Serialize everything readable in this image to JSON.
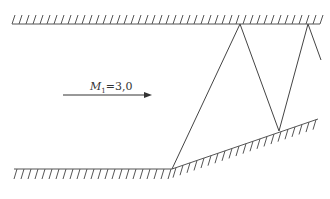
{
  "diagram": {
    "type": "supersonic-channel-shock-reflection",
    "flow_label": {
      "symbol": "M",
      "subscript": "1",
      "equals": "=",
      "value": "3,0"
    },
    "colors": {
      "line": "#444444",
      "background": "#ffffff"
    },
    "upper_wall": {
      "y": 24,
      "x_start": 12,
      "x_end": 320
    },
    "lower_wall": {
      "flat": {
        "x_start": 14,
        "x_end": 172,
        "y": 169
      },
      "ramp": {
        "x_start": 172,
        "y_start": 169,
        "x_end": 318,
        "y_end": 119
      }
    },
    "shock_path": [
      [
        172,
        169
      ],
      [
        240,
        24
      ],
      [
        279,
        131
      ],
      [
        308,
        24
      ],
      [
        321,
        60
      ]
    ],
    "flow_arrow": {
      "x1": 63,
      "y1": 95,
      "x2": 152,
      "y2": 95
    }
  }
}
